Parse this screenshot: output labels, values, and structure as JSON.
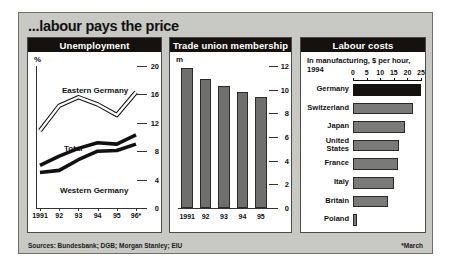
{
  "figure": {
    "title": "...labour pays the price",
    "source": "Sources: Bundesbank; DGB; Morgan Stanley; EIU",
    "footnote": "*March"
  },
  "chart_data": [
    {
      "type": "line",
      "title": "Unemployment",
      "ylabel": "%",
      "xlabel": "",
      "x": [
        "1991",
        "92",
        "93",
        "94",
        "95",
        "96*"
      ],
      "ylim": [
        0,
        20
      ],
      "yticks": [
        0,
        4,
        8,
        12,
        16,
        20
      ],
      "grid": false,
      "legend": "inline-labels",
      "series": [
        {
          "name": "Eastern Germany",
          "style": "hollow",
          "values": [
            10.9,
            14.4,
            15.6,
            14.6,
            13.1,
            16.3
          ]
        },
        {
          "name": "Total",
          "style": "solid",
          "values": [
            6.0,
            7.3,
            8.4,
            9.2,
            9.0,
            10.3
          ]
        },
        {
          "name": "Western Germany",
          "style": "solid",
          "values": [
            5.0,
            5.3,
            6.8,
            8.0,
            8.1,
            9.0
          ]
        }
      ]
    },
    {
      "type": "bar",
      "title": "Trade union membership",
      "ylabel": "m",
      "xlabel": "",
      "categories": [
        "1991",
        "92",
        "93",
        "94",
        "95"
      ],
      "values": [
        11.8,
        10.9,
        10.3,
        9.8,
        9.4
      ],
      "ylim": [
        0,
        12
      ],
      "yticks": [
        0,
        2,
        4,
        6,
        8,
        10,
        12
      ],
      "grid": false
    },
    {
      "type": "bar",
      "orientation": "horizontal",
      "title": "Labour costs",
      "subtitle": "In manufacturing, $ per hour, 1994",
      "xlim": [
        0,
        25
      ],
      "xticks": [
        0,
        5,
        10,
        15,
        20,
        25
      ],
      "categories": [
        "Germany",
        "Switzerland",
        "Japan",
        "United States",
        "France",
        "Italy",
        "Britain",
        "Poland"
      ],
      "values": [
        25.0,
        22.0,
        19.3,
        16.8,
        16.5,
        15.0,
        12.8,
        1.5
      ],
      "highlight_index": 0,
      "grid": false
    }
  ],
  "colors": {
    "figure_background": "#c8c8c4",
    "panel_background": "#ffffff",
    "header_bar": "#15110f",
    "bar_gray": "#6f6f6d",
    "bar_highlight": "#15110f",
    "text": "#111111"
  }
}
